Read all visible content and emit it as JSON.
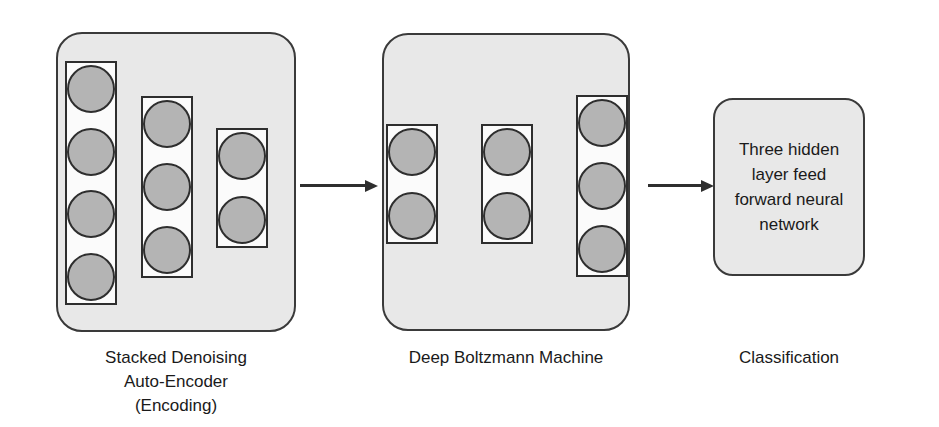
{
  "diagram": {
    "colors": {
      "stage_fill": "#e8e8e8",
      "stage_stroke": "#3a3a3a",
      "layer_fill": "#fbfbfb",
      "layer_stroke": "#2e2e2e",
      "neuron_fill": "#b4b4b4",
      "neuron_stroke": "#2e2e2e",
      "arrow": "#2e2e2e",
      "text": "#1a1a1a",
      "background": "#ffffff"
    },
    "stages": [
      {
        "id": "stacked-denoising-autoencoder",
        "caption": "Stacked Denoising\nAuto-Encoder\n(Encoding)",
        "layers": [
          {
            "id": "sdae-layer-1",
            "neuron_count": 4
          },
          {
            "id": "sdae-layer-2",
            "neuron_count": 3
          },
          {
            "id": "sdae-layer-3",
            "neuron_count": 2
          }
        ]
      },
      {
        "id": "deep-boltzmann-machine",
        "caption": "Deep Boltzmann Machine",
        "layers": [
          {
            "id": "dbm-layer-1",
            "neuron_count": 2
          },
          {
            "id": "dbm-layer-2",
            "neuron_count": 2
          },
          {
            "id": "dbm-layer-3",
            "neuron_count": 3
          }
        ]
      },
      {
        "id": "classification",
        "caption": "Classification",
        "body_text": "Three hidden\nlayer feed\nforward neural\nnetwork",
        "layers": []
      }
    ],
    "arrows": [
      {
        "id": "arrow-sdae-to-dbm",
        "label": ""
      },
      {
        "id": "arrow-dbm-to-classification",
        "label": ""
      }
    ]
  }
}
